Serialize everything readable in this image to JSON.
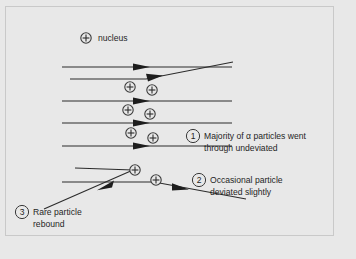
{
  "figure": {
    "background_color": "#e8e8e8",
    "border_color": "#c9c9c9",
    "ink_color": "#222222"
  },
  "legend": {
    "nucleus_symbol": "+",
    "nucleus_label": "nucleus"
  },
  "nuclei": [
    {
      "id": "nucleus-legend",
      "symbol": "+",
      "cx": 86,
      "cy": 38
    },
    {
      "id": "nucleus-1",
      "symbol": "+",
      "cx": 130,
      "cy": 87
    },
    {
      "id": "nucleus-2",
      "symbol": "+",
      "cx": 152,
      "cy": 90
    },
    {
      "id": "nucleus-3",
      "symbol": "+",
      "cx": 128,
      "cy": 110
    },
    {
      "id": "nucleus-4",
      "symbol": "+",
      "cx": 150,
      "cy": 114
    },
    {
      "id": "nucleus-5",
      "symbol": "+",
      "cx": 131,
      "cy": 133
    },
    {
      "id": "nucleus-6",
      "symbol": "+",
      "cx": 153,
      "cy": 138
    },
    {
      "id": "nucleus-7",
      "symbol": "+",
      "cx": 135,
      "cy": 170
    },
    {
      "id": "nucleus-8",
      "symbol": "+",
      "cx": 156,
      "cy": 180
    }
  ],
  "beams": [
    {
      "id": "beam-undeviated-1",
      "path": "M 62 67 L 232 67",
      "arrow_at_x": 148,
      "arrow_y": 67,
      "arrow_dir": "right"
    },
    {
      "id": "beam-deviated-up",
      "path": "M 70 79 L 148 79 L 232 62",
      "arrow_at_x": 160,
      "arrow_y": 76,
      "arrow_dir": "right-up"
    },
    {
      "id": "beam-undeviated-2",
      "path": "M 62 101 L 232 101",
      "arrow_at_x": 148,
      "arrow_y": 101,
      "arrow_dir": "right"
    },
    {
      "id": "beam-undeviated-3",
      "path": "M 62 123 L 232 123",
      "arrow_at_x": 148,
      "arrow_y": 123,
      "arrow_dir": "right"
    },
    {
      "id": "beam-undeviated-4",
      "path": "M 62 146 L 232 146",
      "arrow_at_x": 148,
      "arrow_y": 146,
      "arrow_dir": "right"
    },
    {
      "id": "beam-rebound",
      "path": "M 75 168 L 135 170 L 45 208",
      "arrow_at_x": 104,
      "arrow_y": 186,
      "arrow_dir": "left-down"
    },
    {
      "id": "beam-deviated-down",
      "path": "M 62 182 L 156 182 L 245 199",
      "arrow_at_x": 187,
      "arrow_y": 188,
      "arrow_dir": "right-down"
    }
  ],
  "callouts": [
    {
      "id": "callout-1",
      "number": "1",
      "circle": {
        "cx": 193,
        "cy": 136
      },
      "lines": [
        "Majority of α particles went",
        "through undeviated"
      ]
    },
    {
      "id": "callout-2",
      "number": "2",
      "circle": {
        "cx": 199,
        "cy": 180
      },
      "lines": [
        "Occasional particle",
        "deviated slightly"
      ]
    },
    {
      "id": "callout-3",
      "number": "3",
      "circle": {
        "cx": 22,
        "cy": 212
      },
      "lines": [
        "Rare particle",
        "rebound"
      ]
    }
  ]
}
